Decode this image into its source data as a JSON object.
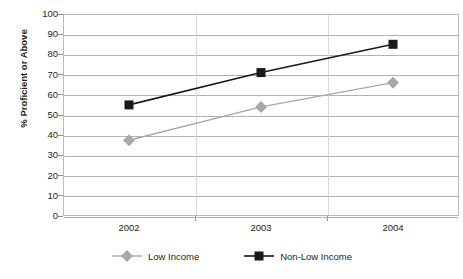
{
  "chart_data": {
    "type": "line",
    "title": "",
    "xlabel": "",
    "ylabel": "% Proficient or Above",
    "categories": [
      "2002",
      "2003",
      "2004"
    ],
    "ylim": [
      0,
      100
    ],
    "ytick_step": 10,
    "yticks": [
      "100",
      "90",
      "80",
      "70",
      "60",
      "50",
      "40",
      "30",
      "20",
      "10",
      "0"
    ],
    "grid": true,
    "legend_position": "bottom",
    "series": [
      {
        "name": "Low Income",
        "values": [
          37.5,
          54,
          66
        ],
        "color": "#a8a8ac",
        "marker": "diamond"
      },
      {
        "name": "Non-Low Income",
        "values": [
          55,
          71,
          85
        ],
        "color": "#1a1a1a",
        "marker": "square"
      }
    ]
  },
  "legend": {
    "items": [
      {
        "label": "Low Income",
        "marker": "diamond-marker-icon"
      },
      {
        "label": "Non-Low Income",
        "marker": "square-marker-icon"
      }
    ]
  }
}
